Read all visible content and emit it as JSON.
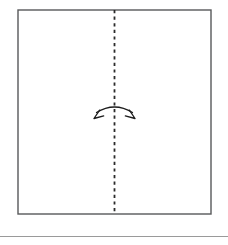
{
  "document": {
    "title": "Paper folding instruction diagram",
    "background_color": "#ffffff"
  },
  "figure": {
    "name": "fold-in-half-vertically",
    "sheet": {
      "label": "paper-sheet",
      "shape": "square",
      "x": 18,
      "y": 10,
      "width": 193,
      "height": 204,
      "fill_color": "#ffffff",
      "stroke_color": "#58595b",
      "stroke_width": 1.4
    },
    "fold_line": {
      "label": "center-fold-line",
      "style": "dashed",
      "orientation": "vertical",
      "x": 114.5,
      "y_start": 10,
      "y_end": 214,
      "stroke_color": "#2b2b2b",
      "stroke_width": 1.8,
      "dash_length": 3.2,
      "dash_gap": 3.4
    },
    "fold_arrow": {
      "label": "double-headed-fold-arrow",
      "type": "curved-double-arrow",
      "center_x": 114.5,
      "center_y": 112,
      "span": 36,
      "arc_rise": 7,
      "stroke_color": "#1c1c1c",
      "stroke_width": 1.3,
      "left_head_direction": "down-left",
      "right_head_direction": "down-right"
    }
  },
  "separator": {
    "label": "bottom-separator-rule",
    "x_start": 0,
    "x_end": 228,
    "y": 236.5,
    "stroke_color": "#9a9a9a",
    "stroke_width": 1.2
  },
  "colors": {
    "sheet_border": "#58595b",
    "fold_line": "#2b2b2b",
    "arrow": "#1c1c1c",
    "separator": "#9a9a9a",
    "page_background": "#ffffff"
  }
}
